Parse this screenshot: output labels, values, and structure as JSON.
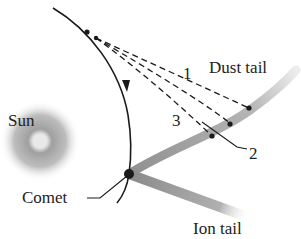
{
  "labels": {
    "sun": "Sun",
    "comet": "Comet",
    "dust_tail": "Dust tail",
    "ion_tail": "Ion tail",
    "p1": "1",
    "p2": "2",
    "p3": "3"
  },
  "colors": {
    "background": "#ffffff",
    "orbit": "#1a1a1a",
    "tail": "#a8a8a8",
    "sun_outer": "#ffffff",
    "sun_mid": "#9a9a9a",
    "sun_core": "#e8e8e8",
    "text": "#222222"
  }
}
